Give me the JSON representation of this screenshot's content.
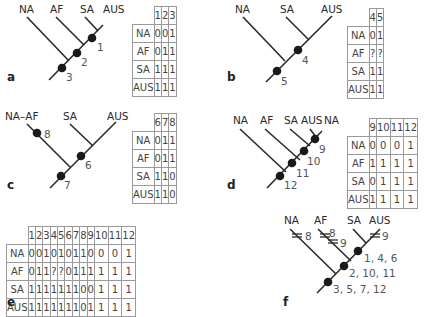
{
  "panels": {
    "a": {
      "label": "a",
      "taxa": [
        "NA",
        "AF",
        "SA",
        "AUS"
      ],
      "nodes": [
        "1",
        "2",
        "3"
      ],
      "table": {
        "columns": [
          "1",
          "2",
          "3"
        ],
        "rows": [
          {
            "taxon": "NA",
            "values": [
              "0",
              "0",
              "1"
            ]
          },
          {
            "taxon": "AF",
            "values": [
              "0",
              "1",
              "1"
            ]
          },
          {
            "taxon": "SA",
            "values": [
              "1",
              "1",
              "1"
            ]
          },
          {
            "taxon": "AUS",
            "values": [
              "1",
              "1",
              "1"
            ]
          }
        ]
      }
    },
    "b": {
      "label": "b",
      "taxa": [
        "NA",
        "SA",
        "AUS"
      ],
      "nodes": [
        "4",
        "5"
      ],
      "table": {
        "columns": [
          "4",
          "5"
        ],
        "rows": [
          {
            "taxon": "NA",
            "values": [
              "0",
              "1"
            ]
          },
          {
            "taxon": "AF",
            "values": [
              "?",
              "?"
            ]
          },
          {
            "taxon": "SA",
            "values": [
              "1",
              "1"
            ]
          },
          {
            "taxon": "AUS",
            "values": [
              "1",
              "1"
            ]
          }
        ]
      }
    },
    "c": {
      "label": "c",
      "taxa": [
        "NA–AF",
        "SA",
        "AUS"
      ],
      "nodes": [
        "8",
        "6",
        "7"
      ],
      "table": {
        "columns": [
          "6",
          "7",
          "8"
        ],
        "rows": [
          {
            "taxon": "NA",
            "values": [
              "0",
              "1",
              "1"
            ]
          },
          {
            "taxon": "AF",
            "values": [
              "0",
              "1",
              "1"
            ]
          },
          {
            "taxon": "SA",
            "values": [
              "1",
              "1",
              "0"
            ]
          },
          {
            "taxon": "AUS",
            "values": [
              "1",
              "1",
              "0"
            ]
          }
        ]
      }
    },
    "d": {
      "label": "d",
      "taxa": [
        "NA",
        "AF",
        "SA",
        "AUS",
        "NA"
      ],
      "nodes": [
        "9",
        "10",
        "11",
        "12"
      ],
      "table": {
        "columns": [
          "9",
          "10",
          "11",
          "12"
        ],
        "rows": [
          {
            "taxon": "NA",
            "values": [
              "0",
              "0",
              "0",
              "1"
            ]
          },
          {
            "taxon": "AF",
            "values": [
              "1",
              "1",
              "1",
              "1"
            ]
          },
          {
            "taxon": "SA",
            "values": [
              "0",
              "1",
              "1",
              "1"
            ]
          },
          {
            "taxon": "AUS",
            "values": [
              "1",
              "1",
              "1",
              "1"
            ]
          }
        ]
      }
    },
    "e": {
      "label": "e",
      "table": {
        "columns": [
          "1",
          "2",
          "3",
          "4",
          "5",
          "6",
          "7",
          "8",
          "9",
          "10",
          "11",
          "12"
        ],
        "rows": [
          {
            "taxon": "NA",
            "values": [
              "0",
              "0",
              "1",
              "0",
              "1",
              "0",
              "1",
              "1",
              "0",
              "0",
              "0",
              "1"
            ]
          },
          {
            "taxon": "AF",
            "values": [
              "0",
              "1",
              "1",
              "?",
              "?",
              "0",
              "1",
              "1",
              "1",
              "1",
              "1",
              "1"
            ]
          },
          {
            "taxon": "SA",
            "values": [
              "1",
              "1",
              "1",
              "1",
              "1",
              "1",
              "1",
              "0",
              "0",
              "1",
              "1",
              "1"
            ]
          },
          {
            "taxon": "AUS",
            "values": [
              "1",
              "1",
              "1",
              "1",
              "1",
              "1",
              "1",
              "0",
              "1",
              "1",
              "1",
              "1"
            ]
          }
        ]
      }
    },
    "f": {
      "label": "f",
      "taxa": [
        "NA",
        "AF",
        "SA",
        "AUS"
      ],
      "homoplasy_marks": {
        "NA": "8",
        "AF_1": "8",
        "AF_2": "9",
        "AUS": "9"
      },
      "node_labels": [
        "1, 4, 6",
        "2, 10, 11",
        "3, 5, 7, 12"
      ]
    }
  },
  "colors": {
    "line": "#2a2a2a",
    "node": "#1a1a1a",
    "grid": "#9a9a9a",
    "number_text": "#555555"
  }
}
